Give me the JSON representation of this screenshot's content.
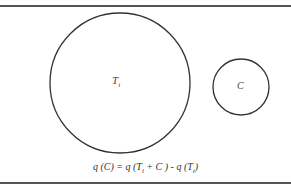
{
  "diagram": {
    "circles": [
      {
        "id": "Ti",
        "label": "T",
        "subscript": "i",
        "cx": 120,
        "cy": 83,
        "r": 70
      },
      {
        "id": "C",
        "label": "C",
        "cx": 241,
        "cy": 87,
        "r": 28
      }
    ],
    "formula": {
      "p1": "q (C) = q (T",
      "s1": "i",
      "p2": " + C ) - q (T",
      "s2": "i",
      "p3": ")"
    },
    "colors": {
      "stroke": "#333333",
      "rule": "#555555"
    }
  }
}
